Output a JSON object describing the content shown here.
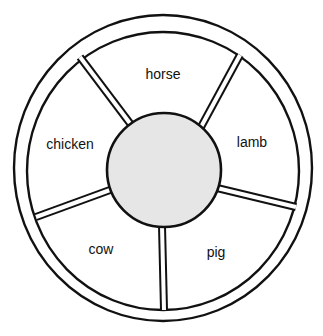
{
  "diagram": {
    "type": "wheel",
    "colors": {
      "stroke": "#111111",
      "background": "#ffffff",
      "hub_fill": "#e6e6e6"
    },
    "hub": {
      "label": ""
    },
    "segments": [
      {
        "label": "horse"
      },
      {
        "label": "lamb"
      },
      {
        "label": "pig"
      },
      {
        "label": "cow"
      },
      {
        "label": "chicken"
      }
    ]
  }
}
